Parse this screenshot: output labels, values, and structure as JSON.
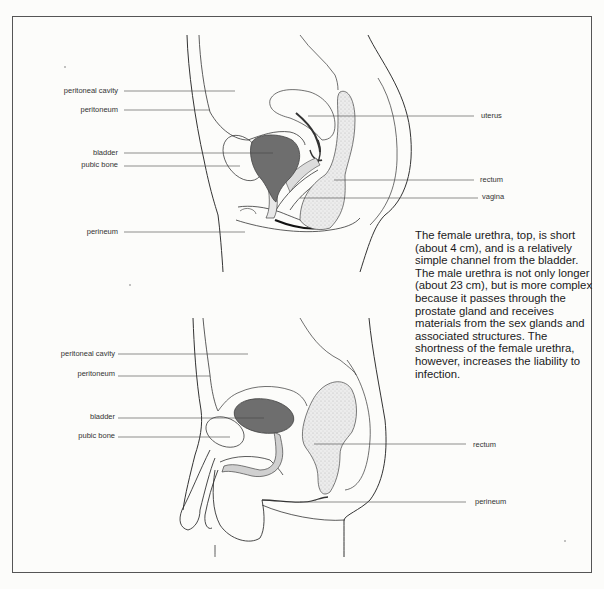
{
  "figure": {
    "caption": "The female urethra, top, is short (about 4 cm), and is a relatively simple channel from the bladder. The male urethra is not only longer (about 23 cm), but is more complex because it passes through the prostate gland and receives materials from the sex glands and associated structures. The shortness of the female urethra, however, increases the liability to infection.",
    "colors": {
      "bladder_fill": "#6e6e6e",
      "line": "#333333",
      "label_text": "#333333",
      "frame": "#555555",
      "stipple": "#d8d8d8"
    },
    "female_diagram": {
      "labels_left": [
        {
          "text": "peritoneal cavity"
        },
        {
          "text": "peritoneum"
        },
        {
          "text": "bladder"
        },
        {
          "text": "pubic bone"
        },
        {
          "text": "perineum"
        }
      ],
      "labels_right": [
        {
          "text": "uterus"
        },
        {
          "text": "rectum"
        },
        {
          "text": "vagina"
        }
      ]
    },
    "male_diagram": {
      "labels_left": [
        {
          "text": "peritoneal cavity"
        },
        {
          "text": "peritoneum"
        },
        {
          "text": "bladder"
        },
        {
          "text": "pubic bone"
        }
      ],
      "labels_right": [
        {
          "text": "rectum"
        },
        {
          "text": "perineum"
        }
      ]
    }
  }
}
